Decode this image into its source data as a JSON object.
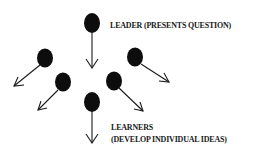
{
  "diagram": {
    "leader": {
      "label": "LEADER (PRESENTS QUESTION)",
      "arrow_direction": "down"
    },
    "learners": {
      "label_line1": "LEARNERS",
      "label_line2": "(DEVELOP INDIVIDUAL IDEAS)",
      "nodes": [
        {
          "id": "learner-upper-left",
          "arrow_direction": "down-left"
        },
        {
          "id": "learner-lower-left",
          "arrow_direction": "down-left"
        },
        {
          "id": "learner-upper-right",
          "arrow_direction": "down-right"
        },
        {
          "id": "learner-lower-right",
          "arrow_direction": "down-right"
        },
        {
          "id": "learner-bottom-center",
          "arrow_direction": "down"
        }
      ]
    },
    "colors": {
      "node": "#0d0d0d",
      "line": "#1a1a1a",
      "background": "#ffffff"
    }
  }
}
